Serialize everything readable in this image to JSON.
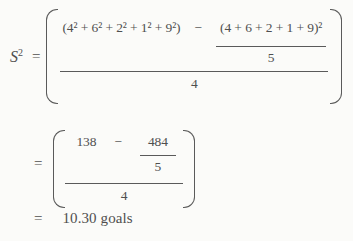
{
  "colors": {
    "background": "#fbfbf9",
    "text": "#4f4f4f",
    "rule": "#5a5a5a"
  },
  "formula": {
    "lhs_base": "S",
    "lhs_exp": "2",
    "equals": "=",
    "step1": {
      "sum_of_squares": "(4² + 6² + 2² + 1² + 9²)",
      "minus": "−",
      "sum_squared": "(4 + 6 + 2 + 1 + 9)²",
      "inner_denominator": "5",
      "outer_denominator": "4"
    },
    "step2": {
      "equals": "=",
      "sum_of_squares_value": "138",
      "minus": "−",
      "sum_squared_value": "484",
      "inner_denominator": "5",
      "outer_denominator": "4"
    },
    "result": {
      "equals": "=",
      "value": "10.30 goals"
    }
  }
}
